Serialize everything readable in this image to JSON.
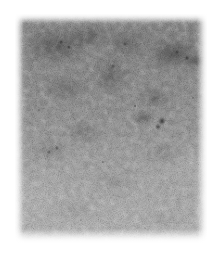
{
  "page": {
    "background_color": "#ffffff",
    "width": 224,
    "height": 267
  },
  "figure": {
    "kind": "micrograph",
    "modality": "grayscale-electron-micrograph",
    "plate": {
      "left": 15,
      "top": 14,
      "width": 192,
      "height": 229,
      "edge_style": "soft-feathered",
      "border": "none"
    },
    "tones": {
      "top_gray": "#868686",
      "mid_gray": "#979797",
      "bottom_gray": "#bdbdbd",
      "darkest_speck": "#141414",
      "page_white": "#ffffff"
    },
    "texture": {
      "description": "dense high-frequency film grain over broad low-frequency mottling",
      "grain_scale": "fine",
      "contrast": "moderate"
    },
    "corner_mark": "",
    "caption": "",
    "scale_bar": null,
    "label": ""
  },
  "annotations": {
    "dark_features": [
      {
        "name": "upper-left-dark-patch",
        "cx": 42,
        "cy": 32
      },
      {
        "name": "upper-right-dark-patch",
        "cx": 158,
        "cy": 40
      },
      {
        "name": "central-dark-particle",
        "cx": 147,
        "cy": 107
      },
      {
        "name": "left-mid-dark-patch",
        "cx": 36,
        "cy": 136
      },
      {
        "name": "upper-center-dark-patch",
        "cx": 112,
        "cy": 30
      }
    ],
    "light_features": [
      {
        "name": "lower-left-light-region",
        "cx": 20,
        "cy": 180
      },
      {
        "name": "right-mid-light-region",
        "cx": 176,
        "cy": 150
      }
    ]
  }
}
